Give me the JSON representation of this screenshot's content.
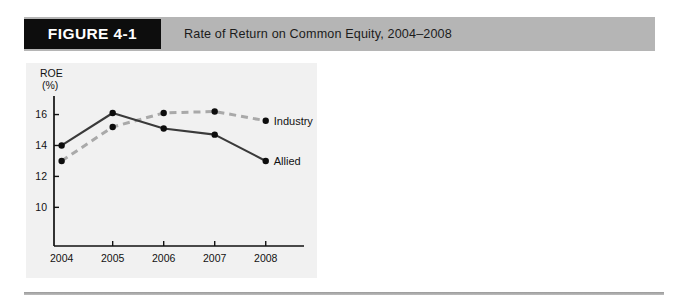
{
  "header": {
    "figure_tag": "FIGURE 4-1",
    "title": "Rate of Return on Common Equity, 2004–2008",
    "band_color": "#b5b5b5",
    "tag_background": "#0d0d0d",
    "tag_text_color": "#ffffff"
  },
  "chart_data": {
    "type": "line",
    "title": "Rate of Return on Common Equity, 2004–2008",
    "xlabel": "",
    "ylabel": "ROE",
    "ylabel_unit": "(%)",
    "categories": [
      "2004",
      "2005",
      "2006",
      "2007",
      "2008"
    ],
    "x": [
      2004,
      2005,
      2006,
      2007,
      2008
    ],
    "yticks": [
      16,
      14,
      12,
      10
    ],
    "ylim": [
      7.5,
      17.2
    ],
    "xlim": [
      2003.85,
      2008.75
    ],
    "grid": false,
    "legend_position": "right-inline",
    "panel_background": "#f1f1f1",
    "series": [
      {
        "name": "Allied",
        "values": [
          14.0,
          16.1,
          15.1,
          14.7,
          13.0
        ],
        "color": "#3a3a3a",
        "style": "solid",
        "marker": "circle"
      },
      {
        "name": "Industry",
        "values": [
          13.0,
          15.2,
          16.1,
          16.2,
          15.6
        ],
        "color": "#a9a9a9",
        "style": "dashed",
        "marker": "circle"
      }
    ],
    "annotations": [
      {
        "text": "Industry",
        "series": "Industry",
        "anchor": "end"
      },
      {
        "text": "Allied",
        "series": "Allied",
        "anchor": "end"
      }
    ]
  },
  "footer": {
    "rule_color": "#9a9a9a"
  }
}
